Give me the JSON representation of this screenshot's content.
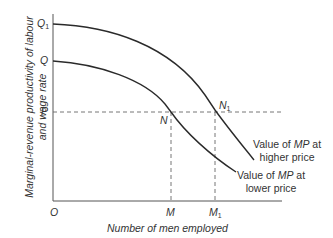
{
  "diagram": {
    "y_axis_label_line1": "Marginal-revenue productivity of labour",
    "y_axis_label_line2": "and wage rate",
    "x_axis_label": "Number of men employed",
    "origin": "O",
    "y_ticks": {
      "q1": "Q",
      "q1_sub": "1",
      "q": "Q",
      "p": "P"
    },
    "x_ticks": {
      "m": "M",
      "m1": "M",
      "m1_sub": "1"
    },
    "points": {
      "n": "N",
      "n1": "N",
      "n1_sub": "1"
    },
    "curves": {
      "higher": {
        "pre": "Value of ",
        "em": "MP",
        "post": " at",
        "line2": "higher price"
      },
      "lower": {
        "pre": "Value of ",
        "em": "MP",
        "post": " at",
        "line2": "lower price"
      }
    },
    "colors": {
      "line": "#2a2a2a",
      "axis": "#555555",
      "dash": "#666666"
    }
  }
}
